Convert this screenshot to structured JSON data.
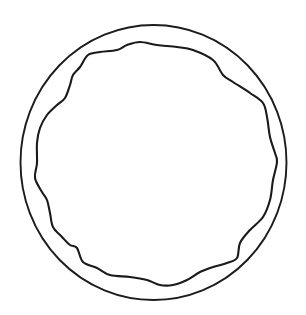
{
  "diagram": {
    "canvas": {
      "width": 306,
      "height": 315,
      "background": "#ffffff"
    },
    "outer_circle": {
      "cx": 153.5,
      "cy": 162.5,
      "rx": 133,
      "ry": 137.5,
      "stroke": "#1c1c1c",
      "stroke_width": 1.9
    },
    "inner_wavy_outline": {
      "stroke": "#1a1a1a",
      "stroke_width": 2.1,
      "points": [
        [
          88,
          55
        ],
        [
          100,
          52
        ],
        [
          117,
          50
        ],
        [
          127,
          45
        ],
        [
          140,
          42
        ],
        [
          157,
          45
        ],
        [
          177,
          47
        ],
        [
          193,
          50
        ],
        [
          213,
          60
        ],
        [
          223,
          75
        ],
        [
          233,
          82
        ],
        [
          250,
          93
        ],
        [
          263,
          103
        ],
        [
          267,
          117
        ],
        [
          270,
          137
        ],
        [
          275,
          153
        ],
        [
          277,
          162
        ],
        [
          273,
          180
        ],
        [
          270,
          200
        ],
        [
          263,
          217
        ],
        [
          250,
          230
        ],
        [
          240,
          243
        ],
        [
          237,
          258
        ],
        [
          227,
          263
        ],
        [
          213,
          267
        ],
        [
          200,
          272
        ],
        [
          187,
          280
        ],
        [
          173,
          285
        ],
        [
          160,
          285
        ],
        [
          147,
          280
        ],
        [
          130,
          277
        ],
        [
          110,
          275
        ],
        [
          97,
          268
        ],
        [
          83,
          262
        ],
        [
          77,
          248
        ],
        [
          70,
          245
        ],
        [
          62,
          237
        ],
        [
          53,
          227
        ],
        [
          50,
          213
        ],
        [
          47,
          200
        ],
        [
          42,
          192
        ],
        [
          35,
          178
        ],
        [
          37,
          163
        ],
        [
          37,
          143
        ],
        [
          40,
          128
        ],
        [
          47,
          115
        ],
        [
          57,
          105
        ],
        [
          65,
          98
        ],
        [
          70,
          85
        ],
        [
          73,
          75
        ],
        [
          80,
          67
        ],
        [
          88,
          55
        ]
      ]
    }
  }
}
